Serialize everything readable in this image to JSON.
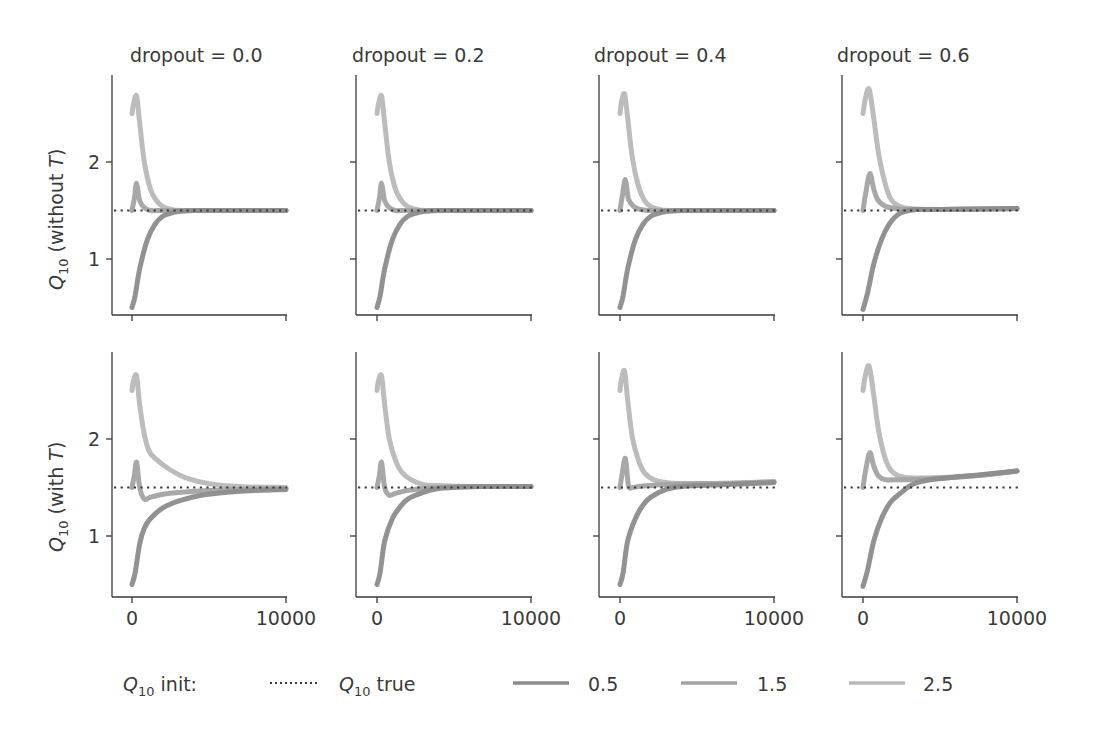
{
  "chart_data": {
    "type": "line",
    "layout": "grid 2 rows x 4 columns, shared axes",
    "xlim": [
      -1300,
      10000
    ],
    "ylim": [
      0.4,
      2.9
    ],
    "xticks": [
      0,
      10000
    ],
    "xtick_labels": [
      "0",
      "10000"
    ],
    "yticks": [
      1,
      2
    ],
    "ytick_labels": [
      "1",
      "2"
    ],
    "grid": false,
    "columns": [
      {
        "title": "dropout = 0.0"
      },
      {
        "title": "dropout = 0.2"
      },
      {
        "title": "dropout = 0.4"
      },
      {
        "title": "dropout = 0.6"
      }
    ],
    "rows": [
      {
        "ylabel": "Q10 (without T)",
        "ylabel_main": "Q",
        "ylabel_sub": "10",
        "ylabel_rest": " (without ",
        "ylabel_italic": "T",
        "ylabel_end": ")"
      },
      {
        "ylabel": "Q10 (with T)",
        "ylabel_main": "Q",
        "ylabel_sub": "10",
        "ylabel_rest": " (with ",
        "ylabel_italic": "T",
        "ylabel_end": ")"
      }
    ],
    "reference_line": {
      "name": "Q10 true",
      "value": 1.5,
      "style": "dotted",
      "color": "#3a3a3a"
    },
    "series_styles": [
      {
        "name": "0.5",
        "color": "#8c8c8c"
      },
      {
        "name": "1.5",
        "color": "#a3a3a3"
      },
      {
        "name": "2.5",
        "color": "#b8b8b8"
      }
    ],
    "panels": [
      {
        "row": 0,
        "col": 0,
        "series": [
          {
            "name": "0.5",
            "x": [
              0,
              200,
              500,
              1000,
              1500,
              2000,
              2500,
              3000,
              4000,
              6000,
              10000
            ],
            "y": [
              0.5,
              0.62,
              0.9,
              1.2,
              1.36,
              1.44,
              1.47,
              1.49,
              1.5,
              1.5,
              1.5
            ]
          },
          {
            "name": "1.5",
            "x": [
              0,
              150,
              300,
              500,
              800,
              1200,
              1800,
              2500,
              4000,
              10000
            ],
            "y": [
              1.5,
              1.62,
              1.78,
              1.6,
              1.53,
              1.5,
              1.5,
              1.5,
              1.5,
              1.5
            ]
          },
          {
            "name": "2.5",
            "x": [
              0,
              100,
              300,
              500,
              800,
              1200,
              1600,
              2000,
              2600,
              3500,
              10000
            ],
            "y": [
              2.5,
              2.6,
              2.68,
              2.4,
              2.0,
              1.72,
              1.6,
              1.54,
              1.51,
              1.5,
              1.5
            ]
          }
        ]
      },
      {
        "row": 0,
        "col": 1,
        "series": [
          {
            "name": "0.5",
            "x": [
              0,
              200,
              500,
              1000,
              1500,
              2000,
              2500,
              3000,
              4000,
              6000,
              10000
            ],
            "y": [
              0.5,
              0.62,
              0.9,
              1.2,
              1.36,
              1.44,
              1.47,
              1.49,
              1.5,
              1.5,
              1.5
            ]
          },
          {
            "name": "1.5",
            "x": [
              0,
              150,
              300,
              500,
              800,
              1200,
              1800,
              2500,
              4000,
              10000
            ],
            "y": [
              1.5,
              1.62,
              1.78,
              1.6,
              1.53,
              1.5,
              1.5,
              1.5,
              1.5,
              1.5
            ]
          },
          {
            "name": "2.5",
            "x": [
              0,
              100,
              300,
              500,
              800,
              1200,
              1600,
              2000,
              2600,
              3500,
              10000
            ],
            "y": [
              2.5,
              2.6,
              2.68,
              2.4,
              2.0,
              1.72,
              1.6,
              1.54,
              1.51,
              1.5,
              1.5
            ]
          }
        ]
      },
      {
        "row": 0,
        "col": 2,
        "series": [
          {
            "name": "0.5",
            "x": [
              0,
              200,
              500,
              1000,
              1500,
              2000,
              2500,
              3000,
              4000,
              6000,
              10000
            ],
            "y": [
              0.5,
              0.62,
              0.9,
              1.2,
              1.36,
              1.44,
              1.47,
              1.49,
              1.5,
              1.5,
              1.5
            ]
          },
          {
            "name": "1.5",
            "x": [
              0,
              150,
              350,
              550,
              900,
              1300,
              1900,
              2600,
              4000,
              10000
            ],
            "y": [
              1.5,
              1.65,
              1.82,
              1.62,
              1.54,
              1.51,
              1.5,
              1.5,
              1.5,
              1.5
            ]
          },
          {
            "name": "2.5",
            "x": [
              0,
              100,
              300,
              500,
              800,
              1200,
              1600,
              2000,
              2600,
              3500,
              10000
            ],
            "y": [
              2.5,
              2.62,
              2.7,
              2.45,
              2.05,
              1.75,
              1.6,
              1.54,
              1.51,
              1.5,
              1.5
            ]
          }
        ]
      },
      {
        "row": 0,
        "col": 3,
        "series": [
          {
            "name": "0.5",
            "x": [
              0,
              300,
              700,
              1200,
              1700,
              2200,
              2700,
              3500,
              5000,
              10000
            ],
            "y": [
              0.48,
              0.65,
              0.95,
              1.2,
              1.36,
              1.45,
              1.49,
              1.51,
              1.51,
              1.52
            ]
          },
          {
            "name": "1.5",
            "x": [
              0,
              200,
              450,
              700,
              1000,
              1500,
              2200,
              3000,
              5000,
              10000
            ],
            "y": [
              1.5,
              1.7,
              1.88,
              1.72,
              1.6,
              1.54,
              1.52,
              1.51,
              1.51,
              1.52
            ]
          },
          {
            "name": "2.5",
            "x": [
              0,
              150,
              400,
              700,
              1000,
              1400,
              1800,
              2300,
              3000,
              5000,
              10000
            ],
            "y": [
              2.5,
              2.65,
              2.75,
              2.45,
              2.1,
              1.8,
              1.62,
              1.55,
              1.52,
              1.51,
              1.52
            ]
          }
        ]
      },
      {
        "row": 1,
        "col": 0,
        "series": [
          {
            "name": "0.5",
            "x": [
              0,
              200,
              500,
              800,
              1200,
              2000,
              3000,
              4500,
              6000,
              8000,
              10000
            ],
            "y": [
              0.5,
              0.62,
              0.92,
              1.08,
              1.18,
              1.29,
              1.36,
              1.42,
              1.45,
              1.47,
              1.48
            ]
          },
          {
            "name": "1.5",
            "x": [
              0,
              150,
              300,
              500,
              800,
              1200,
              2000,
              3000,
              5000,
              7000,
              10000
            ],
            "y": [
              1.5,
              1.62,
              1.76,
              1.5,
              1.38,
              1.4,
              1.43,
              1.45,
              1.47,
              1.48,
              1.49
            ]
          },
          {
            "name": "2.5",
            "x": [
              0,
              100,
              300,
              500,
              800,
              1100,
              1500,
              2500,
              3500,
              5000,
              7000,
              10000
            ],
            "y": [
              2.5,
              2.6,
              2.65,
              2.35,
              2.05,
              1.88,
              1.8,
              1.68,
              1.6,
              1.54,
              1.51,
              1.5
            ]
          }
        ]
      },
      {
        "row": 1,
        "col": 1,
        "series": [
          {
            "name": "0.5",
            "x": [
              0,
              200,
              500,
              1000,
              1500,
              2000,
              3000,
              4000,
              5000,
              7000,
              10000
            ],
            "y": [
              0.5,
              0.62,
              0.95,
              1.18,
              1.3,
              1.38,
              1.45,
              1.49,
              1.5,
              1.51,
              1.51
            ]
          },
          {
            "name": "1.5",
            "x": [
              0,
              150,
              300,
              500,
              800,
              1200,
              2000,
              3000,
              4000,
              6000,
              10000
            ],
            "y": [
              1.5,
              1.62,
              1.76,
              1.5,
              1.42,
              1.44,
              1.47,
              1.49,
              1.5,
              1.51,
              1.51
            ]
          },
          {
            "name": "2.5",
            "x": [
              0,
              100,
              300,
              500,
              800,
              1200,
              1600,
              2200,
              3000,
              4000,
              6000,
              10000
            ],
            "y": [
              2.5,
              2.6,
              2.65,
              2.35,
              2.0,
              1.78,
              1.66,
              1.58,
              1.53,
              1.52,
              1.51,
              1.51
            ]
          }
        ]
      },
      {
        "row": 1,
        "col": 2,
        "series": [
          {
            "name": "0.5",
            "x": [
              0,
              200,
              500,
              1000,
              1500,
              2000,
              3000,
              4000,
              5000,
              7000,
              10000
            ],
            "y": [
              0.5,
              0.62,
              0.95,
              1.18,
              1.32,
              1.4,
              1.48,
              1.51,
              1.52,
              1.53,
              1.55
            ]
          },
          {
            "name": "1.5",
            "x": [
              0,
              150,
              350,
              550,
              800,
              1200,
              2000,
              3000,
              5000,
              7000,
              10000
            ],
            "y": [
              1.5,
              1.65,
              1.8,
              1.52,
              1.5,
              1.51,
              1.52,
              1.53,
              1.54,
              1.54,
              1.56
            ]
          },
          {
            "name": "2.5",
            "x": [
              0,
              100,
              300,
              500,
              800,
              1200,
              1600,
              2200,
              3000,
              4000,
              6000,
              10000
            ],
            "y": [
              2.5,
              2.62,
              2.7,
              2.4,
              2.02,
              1.78,
              1.65,
              1.58,
              1.55,
              1.54,
              1.54,
              1.56
            ]
          }
        ]
      },
      {
        "row": 1,
        "col": 3,
        "series": [
          {
            "name": "0.5",
            "x": [
              0,
              300,
              700,
              1200,
              1800,
              2500,
              3200,
              4000,
              5500,
              7500,
              10000
            ],
            "y": [
              0.48,
              0.65,
              0.95,
              1.18,
              1.35,
              1.45,
              1.53,
              1.57,
              1.6,
              1.63,
              1.67
            ]
          },
          {
            "name": "1.5",
            "x": [
              0,
              200,
              450,
              700,
              1000,
              1500,
              2200,
              3000,
              4500,
              6500,
              8500,
              10000
            ],
            "y": [
              1.5,
              1.7,
              1.86,
              1.72,
              1.62,
              1.58,
              1.58,
              1.58,
              1.59,
              1.61,
              1.64,
              1.67
            ]
          },
          {
            "name": "2.5",
            "x": [
              0,
              150,
              400,
              700,
              1000,
              1400,
              1800,
              2300,
              3000,
              4500,
              7000,
              10000
            ],
            "y": [
              2.5,
              2.65,
              2.75,
              2.45,
              2.1,
              1.82,
              1.68,
              1.62,
              1.6,
              1.6,
              1.62,
              1.67
            ]
          }
        ]
      }
    ],
    "legend": {
      "position": "bottom",
      "title_main": "Q",
      "title_sub": "10",
      "title_rest": " init:",
      "entries": [
        {
          "label_main": "Q",
          "label_sub": "10",
          "label_rest": " true",
          "style": "dotted",
          "color": "#3a3a3a"
        },
        {
          "label": "0.5",
          "style": "solid",
          "color": "#8c8c8c"
        },
        {
          "label": "1.5",
          "style": "solid",
          "color": "#a3a3a3"
        },
        {
          "label": "2.5",
          "style": "solid",
          "color": "#b8b8b8"
        }
      ]
    }
  }
}
